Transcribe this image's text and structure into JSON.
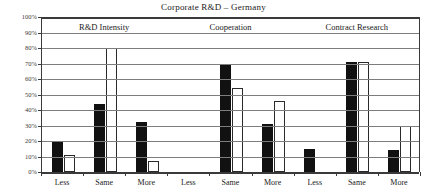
{
  "chart_data": {
    "type": "bar",
    "title": "Corporate R&D – Germany",
    "xlabel": "",
    "ylabel": "",
    "ylim": [
      0,
      100
    ],
    "yticks": [
      "0%",
      "10%",
      "20%",
      "30%",
      "40%",
      "50%",
      "60%",
      "70%",
      "80%",
      "90%",
      "100%"
    ],
    "grid": true,
    "legend": "none",
    "group_labels": [
      "R&D Intensity",
      "Cooperation",
      "Contract Research"
    ],
    "categories": [
      "Less",
      "Same",
      "More",
      "Less",
      "Same",
      "More",
      "Less",
      "Same",
      "More"
    ],
    "series": [
      {
        "name": "dark",
        "color": "#111111",
        "values": [
          20,
          44,
          32,
          0,
          70,
          31,
          15,
          71,
          14
        ]
      },
      {
        "name": "light",
        "color": "#ffffff",
        "values": [
          11,
          80,
          7,
          0,
          54,
          46,
          0,
          71,
          30
        ]
      }
    ],
    "groups": [
      {
        "label": "R&D Intensity",
        "categories": [
          "Less",
          "Same",
          "More"
        ],
        "dark": [
          20,
          44,
          32
        ],
        "light": [
          11,
          80,
          7
        ]
      },
      {
        "label": "Cooperation",
        "categories": [
          "Less",
          "Same",
          "More"
        ],
        "dark": [
          0,
          70,
          31
        ],
        "light": [
          0,
          54,
          46
        ]
      },
      {
        "label": "Contract Research",
        "categories": [
          "Less",
          "Same",
          "More"
        ],
        "dark": [
          15,
          71,
          14
        ],
        "light": [
          0,
          71,
          30
        ]
      }
    ]
  },
  "colors": {
    "axis": "#3a3a3a",
    "gridline": "#7d7d7d",
    "dark_bar": "#111111",
    "light_bar_fill": "#ffffff",
    "light_bar_stroke": "#2a2a2a",
    "background": "#ffffff"
  }
}
